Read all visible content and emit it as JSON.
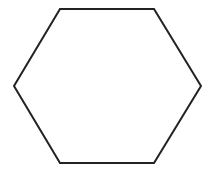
{
  "diagram": {
    "shape": "hexagon",
    "stroke_color": "#222222",
    "fill_color": "#ffffff",
    "stroke_width": 2,
    "points": "60,9 154,9 201,86 154,163 60,163 14,86"
  }
}
